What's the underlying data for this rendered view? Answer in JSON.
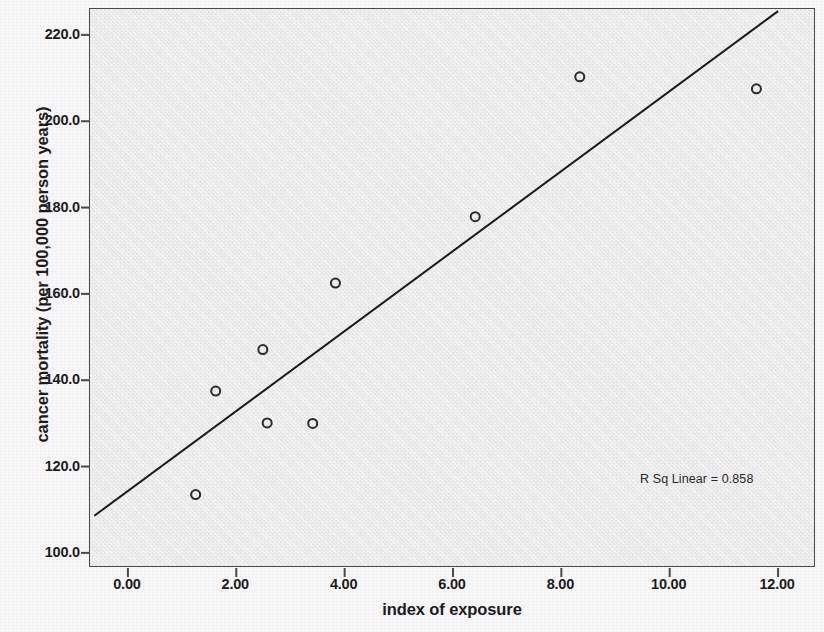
{
  "chart_data": {
    "type": "scatter",
    "title": "",
    "xlabel": "index of exposure",
    "ylabel": "cancer mortality (per 100,000 person years)",
    "xlim": [
      -0.7,
      12.7
    ],
    "ylim": [
      96.5,
      226.0
    ],
    "xticks": [
      "0.00",
      "2.00",
      "4.00",
      "6.00",
      "8.00",
      "10.00",
      "12.00"
    ],
    "xtick_values": [
      0,
      2,
      4,
      6,
      8,
      10,
      12
    ],
    "yticks": [
      "100.0",
      "120.0",
      "140.0",
      "160.0",
      "180.0",
      "200.0",
      "220.0"
    ],
    "ytick_values": [
      100,
      120,
      140,
      160,
      180,
      200,
      220
    ],
    "grid": false,
    "legend": false,
    "points": [
      {
        "x": 1.25,
        "y": 113.5
      },
      {
        "x": 1.62,
        "y": 137.5
      },
      {
        "x": 2.49,
        "y": 147.1
      },
      {
        "x": 2.57,
        "y": 130.1
      },
      {
        "x": 3.41,
        "y": 130.0
      },
      {
        "x": 3.83,
        "y": 162.5
      },
      {
        "x": 6.41,
        "y": 177.9
      },
      {
        "x": 8.34,
        "y": 210.3
      },
      {
        "x": 11.6,
        "y": 207.5
      }
    ],
    "marker": {
      "shape": "circle-open",
      "size": 9,
      "color": "#2b2b2b"
    },
    "fit_line": {
      "type": "linear",
      "color": "#1a1a1a",
      "width": 2,
      "x_start": -0.62,
      "y_start": 108.6,
      "x_end": 12.0,
      "y_end": 225.5
    },
    "annotations": [
      {
        "name": "r-squared",
        "text": "R Sq Linear = 0.858",
        "x": 10.3,
        "y": 114.0
      }
    ]
  },
  "axes": {
    "x_title": "index of exposure",
    "y_title": "cancer mortality (per 100,000 person years)"
  },
  "colors": {
    "page_background": "#f7f7f7",
    "plot_background": "#ececec",
    "frame": "#4a4a4a",
    "text": "#1c1c1c",
    "marker": "#2b2b2b",
    "fit_line": "#1a1a1a"
  }
}
